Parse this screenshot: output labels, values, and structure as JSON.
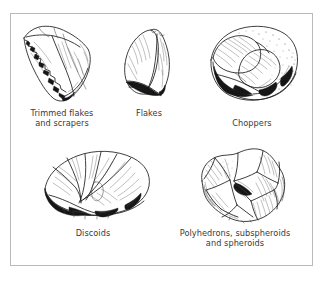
{
  "figure": {
    "background_color": "#ffffff",
    "border_color": "#b9b9b9",
    "ink_color": "#1c1c1c",
    "caption_color": "#3a3a3a"
  },
  "specimens": [
    {
      "id": "trimmed-flakes",
      "icon": "stone-tool-trimmed-flake-icon",
      "caption": "Trimmed flakes\nand scrapers"
    },
    {
      "id": "flakes",
      "icon": "stone-tool-flake-icon",
      "caption": "Flakes"
    },
    {
      "id": "choppers",
      "icon": "stone-tool-chopper-icon",
      "caption": "Choppers"
    },
    {
      "id": "discoids",
      "icon": "stone-tool-discoid-icon",
      "caption": "Discoids"
    },
    {
      "id": "polyhedrons",
      "icon": "stone-tool-polyhedron-icon",
      "caption": "Polyhedrons, subspheroids\nand spheroids"
    }
  ]
}
